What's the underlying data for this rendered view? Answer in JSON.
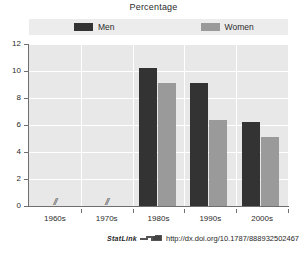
{
  "chart_data": {
    "type": "bar",
    "title": "Percentage",
    "xlabel": "",
    "ylabel": "",
    "categories": [
      "1960s",
      "1970s",
      "1980s",
      "1990s",
      "2000s"
    ],
    "series": [
      {
        "name": "Men",
        "color": "#333333",
        "values": [
          null,
          null,
          10.2,
          9.1,
          6.2
        ]
      },
      {
        "name": "Women",
        "color": "#9a9a9a",
        "values": [
          null,
          null,
          9.1,
          6.4,
          5.1
        ]
      }
    ],
    "ylim": [
      0,
      12
    ],
    "yticks": [
      0,
      2,
      4,
      6,
      8,
      10,
      12
    ],
    "grid": true,
    "legend_position": "top",
    "missing_data_marker": "//",
    "missing_data_categories": [
      "1960s",
      "1970s"
    ]
  },
  "legend": {
    "items": [
      {
        "label": "Men"
      },
      {
        "label": "Women"
      }
    ]
  },
  "footer": {
    "statlink_label": "StatLink",
    "url": "http://dx.doi.org/10.1787/888932502467"
  }
}
